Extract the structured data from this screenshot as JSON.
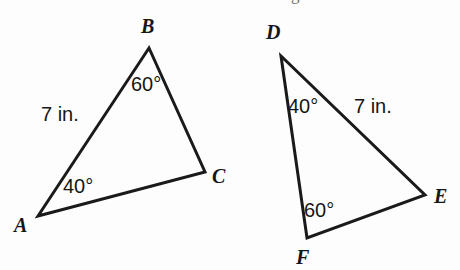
{
  "figure": {
    "background_color": "#fdfdfd",
    "stroke_color": "#1a1a1a",
    "text_color": "#161616",
    "stroke_width": 3,
    "width": 460,
    "height": 270,
    "cut_off_top_text": "g",
    "triangles": [
      {
        "id": "ABC",
        "name": "triangle-abc",
        "vertices": [
          {
            "label": "A",
            "x": 38,
            "y": 216,
            "label_x": 14,
            "label_y": 215
          },
          {
            "label": "B",
            "x": 149,
            "y": 48,
            "label_x": 141,
            "label_y": 16
          },
          {
            "label": "C",
            "x": 205,
            "y": 172,
            "label_x": 212,
            "label_y": 166
          }
        ],
        "path": "M 38 216 L 149 48 L 205 172 Z",
        "annotations": [
          {
            "text": "60°",
            "kind": "angle",
            "at_vertex": "B",
            "x": 131,
            "y": 74
          },
          {
            "text": "40°",
            "kind": "angle",
            "at_vertex": "A",
            "x": 63,
            "y": 176
          },
          {
            "text": "7 in.",
            "kind": "side",
            "on_side": "AB",
            "x": 41,
            "y": 104
          }
        ]
      },
      {
        "id": "DEF",
        "name": "triangle-def",
        "vertices": [
          {
            "label": "D",
            "x": 281,
            "y": 56,
            "label_x": 266,
            "label_y": 22
          },
          {
            "label": "E",
            "x": 425,
            "y": 195,
            "label_x": 434,
            "label_y": 186
          },
          {
            "label": "F",
            "x": 307,
            "y": 238,
            "label_x": 296,
            "label_y": 247
          }
        ],
        "path": "M 281 56 L 425 195 L 307 238 Z",
        "annotations": [
          {
            "text": "40°",
            "kind": "angle",
            "at_vertex": "D",
            "x": 288,
            "y": 96
          },
          {
            "text": "7 in.",
            "kind": "side",
            "on_side": "DE",
            "x": 354,
            "y": 96
          },
          {
            "text": "60°",
            "kind": "angle",
            "at_vertex": "F",
            "x": 304,
            "y": 200
          }
        ]
      }
    ]
  }
}
